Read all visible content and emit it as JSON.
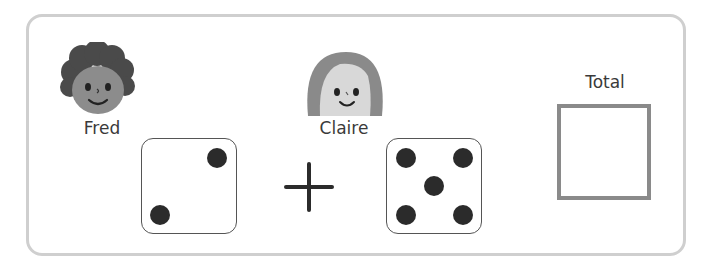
{
  "players": [
    {
      "name": "Fred",
      "die_value": 2
    },
    {
      "name": "Claire",
      "die_value": 5
    }
  ],
  "operator": "+",
  "total": {
    "label": "Total",
    "value": ""
  },
  "colors": {
    "frame_border": "#cfcfcf",
    "total_box_border": "#8a8a8a",
    "pip": "#2b2b2b"
  }
}
